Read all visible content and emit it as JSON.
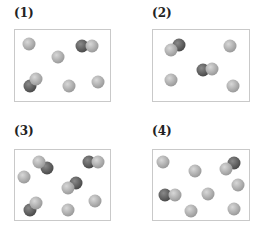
{
  "colors": {
    "light_atom": "#9a9a9a",
    "light_atom_highlight": "#d8d8d8",
    "dark_atom": "#4a4a4a",
    "dark_atom_highlight": "#8a8a8a",
    "border": "#c9c9c9"
  },
  "atom_radius": 6.5,
  "panels": [
    {
      "label": "(1)",
      "label_pos": [
        14,
        6
      ],
      "box": [
        14,
        29,
        97,
        73
      ],
      "atoms": [
        {
          "type": "light",
          "x": 29,
          "y": 44
        },
        {
          "type": "light",
          "x": 58,
          "y": 57
        },
        {
          "type": "light",
          "x": 69,
          "y": 86
        },
        {
          "type": "light",
          "x": 98,
          "y": 82
        },
        {
          "type": "dark",
          "x": 82,
          "y": 46
        },
        {
          "type": "light",
          "x": 92,
          "y": 46
        },
        {
          "type": "light",
          "x": 36,
          "y": 79
        },
        {
          "type": "dark",
          "x": 30,
          "y": 86
        }
      ]
    },
    {
      "label": "(2)",
      "label_pos": [
        152,
        6
      ],
      "box": [
        152,
        29,
        98,
        73
      ],
      "atoms": [
        {
          "type": "dark",
          "x": 179,
          "y": 45
        },
        {
          "type": "light",
          "x": 171,
          "y": 50
        },
        {
          "type": "light",
          "x": 230,
          "y": 46
        },
        {
          "type": "dark",
          "x": 203,
          "y": 70
        },
        {
          "type": "light",
          "x": 212,
          "y": 69
        },
        {
          "type": "light",
          "x": 171,
          "y": 80
        },
        {
          "type": "light",
          "x": 233,
          "y": 86
        }
      ]
    },
    {
      "label": "(3)",
      "label_pos": [
        14,
        124
      ],
      "box": [
        14,
        149,
        97,
        72
      ],
      "atoms": [
        {
          "type": "light",
          "x": 39,
          "y": 162
        },
        {
          "type": "dark",
          "x": 47,
          "y": 168
        },
        {
          "type": "light",
          "x": 24,
          "y": 177
        },
        {
          "type": "dark",
          "x": 89,
          "y": 162
        },
        {
          "type": "light",
          "x": 98,
          "y": 162
        },
        {
          "type": "dark",
          "x": 76,
          "y": 183
        },
        {
          "type": "light",
          "x": 68,
          "y": 188
        },
        {
          "type": "light",
          "x": 36,
          "y": 203
        },
        {
          "type": "dark",
          "x": 30,
          "y": 210
        },
        {
          "type": "light",
          "x": 68,
          "y": 210
        },
        {
          "type": "light",
          "x": 95,
          "y": 201
        }
      ]
    },
    {
      "label": "(4)",
      "label_pos": [
        152,
        124
      ],
      "box": [
        152,
        149,
        98,
        72
      ],
      "atoms": [
        {
          "type": "light",
          "x": 163,
          "y": 162
        },
        {
          "type": "light",
          "x": 195,
          "y": 171
        },
        {
          "type": "dark",
          "x": 234,
          "y": 163
        },
        {
          "type": "light",
          "x": 226,
          "y": 169
        },
        {
          "type": "light",
          "x": 238,
          "y": 185
        },
        {
          "type": "dark",
          "x": 165,
          "y": 195
        },
        {
          "type": "light",
          "x": 175,
          "y": 195
        },
        {
          "type": "light",
          "x": 208,
          "y": 194
        },
        {
          "type": "light",
          "x": 191,
          "y": 211
        },
        {
          "type": "light",
          "x": 234,
          "y": 209
        }
      ]
    }
  ]
}
